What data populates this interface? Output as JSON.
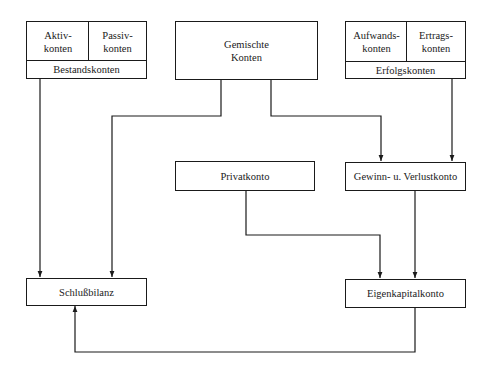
{
  "diagram": {
    "nodes": {
      "bestandskonten": {
        "left": "Aktiv-\nkonten",
        "right": "Passiv-\nkonten",
        "bottom": "Bestandskonten"
      },
      "gemischte_konten": {
        "label": "Gemischte\nKonten"
      },
      "erfolgskonten": {
        "left": "Aufwands-\nkonten",
        "right": "Ertrags-\nkonten",
        "bottom": "Erfolgskonten"
      },
      "privatkonto": {
        "label": "Privatkonto"
      },
      "guv_konto": {
        "label": "Gewinn- u. Verlustkonto"
      },
      "schlussbilanz": {
        "label": "Schlußbilanz"
      },
      "eigenkapitalkonto": {
        "label": "Eigenkapitalkonto"
      }
    },
    "edges": [
      {
        "from": "Bestandskonten",
        "to": "Schlußbilanz"
      },
      {
        "from": "Gemischte Konten",
        "to": "Schlußbilanz"
      },
      {
        "from": "Gemischte Konten",
        "to": "Gewinn- u. Verlustkonto"
      },
      {
        "from": "Erfolgskonten",
        "to": "Gewinn- u. Verlustkonto"
      },
      {
        "from": "Privatkonto",
        "to": "Eigenkapitalkonto"
      },
      {
        "from": "Gewinn- u. Verlustkonto",
        "to": "Eigenkapitalkonto"
      },
      {
        "from": "Eigenkapitalkonto",
        "to": "Schlußbilanz"
      }
    ],
    "colors": {
      "line": "#1a1a1a",
      "background": "#ffffff"
    }
  }
}
